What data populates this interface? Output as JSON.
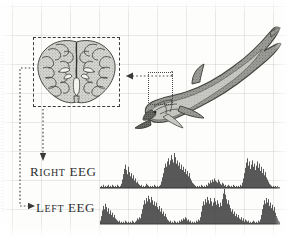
{
  "figure": {
    "background_color": "#fdfdfc",
    "grid_color": "#aab4af",
    "ink_color": "#2e2e2e"
  },
  "brain": {
    "name": "brain-cross-section",
    "box_style": "dashed",
    "box_color": "#3b3b3b",
    "description": "coronal cross-section of a cetacean brain with two hemispheres"
  },
  "dolphin": {
    "name": "dolphin-illustration",
    "description": "bottlenose dolphin drawn diagonally, head lower-left, flukes upper-right",
    "head_box_style": "dotted",
    "head_box_color": "#4a4a4a"
  },
  "connectors": [
    {
      "name": "dolphin-head-to-brain",
      "direction": "left",
      "style": "dotted",
      "color": "#4a4a4a"
    },
    {
      "name": "brain-to-right-eeg",
      "direction": "down",
      "style": "dotted",
      "color": "#4a4a4a"
    },
    {
      "name": "brain-to-left-eeg",
      "direction": "down-then-right",
      "style": "dotted",
      "color": "#4a4a4a"
    }
  ],
  "eeg": {
    "rows": [
      {
        "name": "right-eeg",
        "label_initial": "R",
        "label_rest": "IGHT",
        "label_suffix": "EEG",
        "label_full": "Right EEG",
        "trace_color": "#3a3a3a",
        "baseline_color": "#2e2e2e"
      },
      {
        "name": "left-eeg",
        "label_initial": "L",
        "label_rest": "EFT",
        "label_suffix": "EEG",
        "label_full": "Left EEG",
        "trace_color": "#3a3a3a",
        "baseline_color": "#2e2e2e"
      }
    ]
  },
  "chart_data": {
    "type": "line",
    "subtitle": "",
    "xlabel": "",
    "ylabel": "",
    "grid": true,
    "legend_position": "left",
    "axis_ranges": {
      "x": [
        0,
        180
      ],
      "y": [
        0,
        34
      ]
    },
    "series": [
      {
        "name": "Right EEG",
        "label": "Right EEG",
        "x_start": 0,
        "x_step": 1.0,
        "values": [
          1,
          2,
          1,
          3,
          1,
          2,
          1,
          2,
          3,
          1,
          2,
          1,
          3,
          2,
          1,
          2,
          1,
          3,
          2,
          1,
          2,
          4,
          8,
          13,
          18,
          22,
          17,
          13,
          20,
          15,
          11,
          14,
          9,
          12,
          7,
          9,
          5,
          6,
          4,
          3,
          2,
          3,
          1,
          2,
          1,
          2,
          4,
          3,
          2,
          1,
          2,
          1,
          2,
          1,
          3,
          2,
          1,
          2,
          1,
          2,
          3,
          6,
          10,
          14,
          19,
          23,
          20,
          25,
          28,
          22,
          26,
          31,
          27,
          24,
          33,
          29,
          23,
          26,
          21,
          24,
          18,
          22,
          17,
          20,
          15,
          18,
          13,
          16,
          11,
          14,
          9,
          7,
          5,
          4,
          3,
          2,
          1,
          2,
          1,
          2,
          1,
          3,
          2,
          1,
          2,
          1,
          3,
          2,
          5,
          4,
          7,
          5,
          8,
          6,
          9,
          7,
          6,
          5,
          8,
          6,
          4,
          3,
          5,
          4,
          2,
          3,
          1,
          2,
          3,
          2,
          1,
          2,
          1,
          3,
          2,
          1,
          2,
          1,
          2,
          1,
          3,
          2,
          5,
          9,
          14,
          19,
          24,
          28,
          21,
          25,
          18,
          22,
          26,
          20,
          23,
          17,
          21,
          25,
          19,
          23,
          16,
          20,
          14,
          18,
          12,
          15,
          10,
          8,
          6,
          4,
          3,
          2,
          1,
          2,
          1,
          2,
          1,
          2,
          1,
          1
        ]
      },
      {
        "name": "Left EEG",
        "label": "Left EEG",
        "x_start": 0,
        "x_step": 1.0,
        "values": [
          3,
          7,
          12,
          16,
          13,
          18,
          15,
          11,
          14,
          9,
          12,
          8,
          10,
          6,
          8,
          5,
          4,
          3,
          2,
          3,
          1,
          2,
          1,
          2,
          1,
          3,
          2,
          1,
          2,
          1,
          2,
          1,
          3,
          2,
          1,
          2,
          3,
          5,
          4,
          6,
          5,
          9,
          13,
          17,
          21,
          18,
          23,
          20,
          25,
          22,
          19,
          24,
          21,
          17,
          20,
          16,
          19,
          15,
          13,
          16,
          11,
          14,
          9,
          11,
          7,
          9,
          6,
          4,
          3,
          2,
          3,
          1,
          2,
          1,
          3,
          2,
          1,
          2,
          1,
          3,
          2,
          4,
          3,
          5,
          4,
          6,
          5,
          3,
          4,
          2,
          3,
          1,
          2,
          1,
          2,
          1,
          3,
          2,
          4,
          3,
          6,
          11,
          16,
          20,
          17,
          22,
          19,
          24,
          21,
          18,
          23,
          20,
          16,
          19,
          23,
          20,
          17,
          21,
          18,
          15,
          19,
          16,
          22,
          27,
          31,
          26,
          22,
          18,
          21,
          17,
          14,
          11,
          13,
          9,
          11,
          7,
          9,
          6,
          8,
          5,
          4,
          6,
          3,
          5,
          2,
          4,
          3,
          2,
          3,
          1,
          2,
          1,
          2,
          3,
          2,
          1,
          2,
          1,
          3,
          2,
          4,
          8,
          13,
          17,
          21,
          18,
          23,
          19,
          22,
          16,
          19,
          14,
          17,
          12,
          15,
          10,
          7,
          5,
          3,
          2
        ]
      }
    ]
  }
}
